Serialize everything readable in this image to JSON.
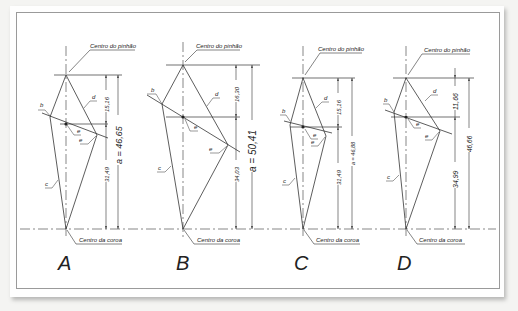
{
  "figure": {
    "panels": [
      {
        "id": "A",
        "label": "A",
        "pinion_label": "Centro do pinhão",
        "crown_label": "Centro da coroa",
        "dim_upper": "15,16",
        "dim_lower": "31,49",
        "dim_total": "a = 46,65",
        "line_labels": [
          "b",
          "c",
          "d",
          "e",
          "e"
        ]
      },
      {
        "id": "B",
        "label": "B",
        "pinion_label": "Centro do pinhão",
        "crown_label": "Centro da coroa",
        "dim_upper": "16,30",
        "dim_lower": "34,03",
        "dim_total": "a = 50,41",
        "line_labels": [
          "b",
          "c",
          "d",
          "e",
          "e"
        ]
      },
      {
        "id": "C",
        "label": "C",
        "pinion_label": "Centro do pinhão",
        "crown_label": "Centro da coroa",
        "dim_upper": "15,16",
        "dim_lower": "31,49",
        "dim_total": "a = 46,88",
        "line_labels": [
          "b",
          "c",
          "d",
          "e",
          "e"
        ]
      },
      {
        "id": "D",
        "label": "D",
        "pinion_label": "Centro do pinhão",
        "crown_label": "Centro da coroa",
        "dim_upper": "11,66",
        "dim_lower": "34,99",
        "dim_total": "46,66",
        "line_labels": [
          "b",
          "c",
          "d",
          "e",
          "e"
        ]
      }
    ]
  }
}
